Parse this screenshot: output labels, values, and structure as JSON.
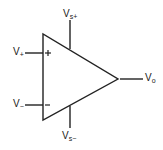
{
  "diagram": {
    "type": "op-amp symbol",
    "labels": {
      "supply_positive": {
        "main": "V",
        "sub": "s+"
      },
      "supply_negative": {
        "main": "V",
        "sub": "s−"
      },
      "input_noninverting": {
        "main": "V",
        "sub": "+"
      },
      "input_inverting": {
        "main": "V",
        "sub": "−"
      },
      "output": {
        "main": "V",
        "sub": "o"
      }
    },
    "pin_marks": {
      "noninverting": "+",
      "inverting": "-"
    },
    "colors": {
      "stroke": "#222222",
      "background": "#ffffff"
    }
  }
}
